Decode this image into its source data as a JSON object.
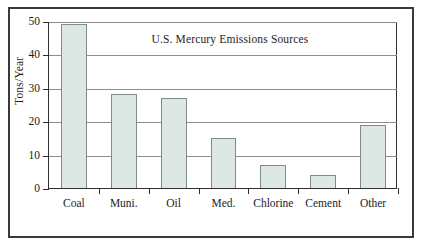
{
  "chart_data": {
    "type": "bar",
    "title": "U.S. Mercury Emissions Sources",
    "xlabel": "",
    "ylabel": "Tons/Year",
    "categories": [
      "Coal",
      "Muni.",
      "Oil",
      "Med.",
      "Chlorine",
      "Cement",
      "Other"
    ],
    "values": [
      49,
      28,
      27,
      15,
      7,
      4,
      19
    ],
    "ylim": [
      0,
      50
    ],
    "yticks": [
      0,
      10,
      20,
      30,
      40,
      50
    ],
    "ytick_labels": [
      "0",
      "10",
      "20",
      "30",
      "40",
      "50"
    ],
    "grid": true,
    "legend": false,
    "bar_fill_color": "#dde7e3",
    "bar_border_color": "#7e8d88",
    "axis_color": "#2e2e2e",
    "gridline_color": "#8d8d8d",
    "frame_color": "#3a3a3a",
    "background_color": "#ffffff"
  }
}
